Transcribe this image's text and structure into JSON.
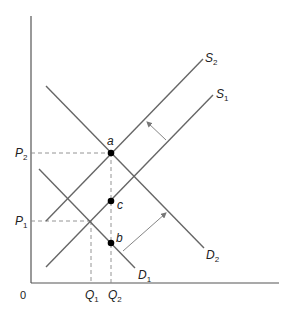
{
  "diagram": {
    "type": "supply-demand",
    "colors": {
      "axis": "#555555",
      "curve": "#666666",
      "dash": "#888888",
      "point": "#000000",
      "arrow": "#777777",
      "text": "#222222"
    },
    "axes": {
      "origin_label": "0",
      "origin": {
        "x": 31,
        "y": 283
      },
      "y_top": 16,
      "x_right": 279
    },
    "curves": [
      {
        "id": "S2",
        "main": "S",
        "sub": "2",
        "x1": 46,
        "y1": 221,
        "x2": 203,
        "y2": 59,
        "label_x": 205,
        "label_y": 62
      },
      {
        "id": "S1",
        "main": "S",
        "sub": "1",
        "x1": 46,
        "y1": 267,
        "x2": 213,
        "y2": 95,
        "label_x": 216,
        "label_y": 98
      },
      {
        "id": "D2",
        "main": "D",
        "sub": "2",
        "x1": 46,
        "y1": 86,
        "x2": 204,
        "y2": 248,
        "label_x": 206,
        "label_y": 259
      },
      {
        "id": "D1",
        "main": "D",
        "sub": "1",
        "x1": 39,
        "y1": 169,
        "x2": 135,
        "y2": 268,
        "label_x": 138,
        "label_y": 279
      }
    ],
    "points": [
      {
        "id": "a",
        "label": "a",
        "x": 111,
        "y": 153,
        "label_x": 107,
        "label_y": 145
      },
      {
        "id": "c",
        "label": "c",
        "x": 111,
        "y": 201,
        "label_x": 117,
        "label_y": 209
      },
      {
        "id": "b",
        "label": "b",
        "x": 111,
        "y": 243,
        "label_x": 116,
        "label_y": 242
      }
    ],
    "price_levels": [
      {
        "id": "P2",
        "main": "P",
        "sub": "2",
        "y": 153,
        "x_end": 111,
        "label_x": 15,
        "label_y": 157
      },
      {
        "id": "P1",
        "main": "P",
        "sub": "1",
        "y": 221,
        "x_end": 91,
        "label_x": 15,
        "label_y": 225
      }
    ],
    "quantity_levels": [
      {
        "id": "Q1",
        "main": "Q",
        "sub": "1",
        "x": 91,
        "y_start": 221,
        "label_x": 85,
        "label_y": 299
      },
      {
        "id": "Q2",
        "main": "Q",
        "sub": "2",
        "x": 111,
        "y_start": 153,
        "label_x": 108,
        "label_y": 299
      }
    ],
    "shift_arrows": [
      {
        "id": "supply-shift-arrow",
        "from": {
          "x": 166,
          "y": 140
        },
        "to": {
          "x": 147,
          "y": 122
        }
      },
      {
        "id": "demand-shift-arrow",
        "from": {
          "x": 123,
          "y": 251
        },
        "to": {
          "x": 166,
          "y": 213
        }
      }
    ]
  }
}
